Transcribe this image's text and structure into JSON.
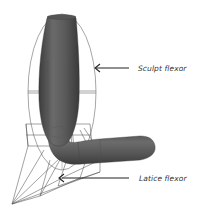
{
  "figure": {
    "labels": {
      "sculpt": "Sculpt flexor",
      "latice": "Latice flexor"
    },
    "colors": {
      "mesh": "#5e5e5e",
      "mesh_dark": "#3f3f3f",
      "mesh_light": "#7a7a7a",
      "wire": "#555555",
      "arrow": "#222222",
      "text": "#333333"
    },
    "icons": {
      "sculpt_arrow": "left-arrow-icon",
      "latice_arrow": "left-arrow-icon"
    }
  }
}
